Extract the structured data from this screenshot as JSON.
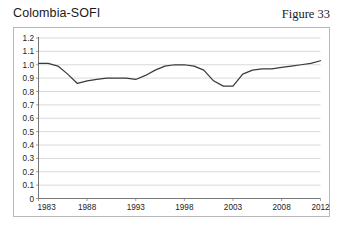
{
  "header": {
    "title": "Colombia-SOFI",
    "figure_label": "Figure 33"
  },
  "chart_data": {
    "type": "line",
    "title": "Colombia-SOFI",
    "xlabel": "",
    "ylabel": "",
    "xlim": [
      1983,
      2012
    ],
    "ylim": [
      0,
      1.2
    ],
    "grid": true,
    "legend": false,
    "y_ticks": [
      "0",
      "0.1",
      "0.2",
      "0.3",
      "0.4",
      "0.5",
      "0.6",
      "0.7",
      "0.8",
      "0.9",
      "1.0",
      "1.1",
      "1.2"
    ],
    "y_tick_values": [
      0,
      0.1,
      0.2,
      0.3,
      0.4,
      0.5,
      0.6,
      0.7,
      0.8,
      0.9,
      1.0,
      1.1,
      1.2
    ],
    "x_ticks": [
      "1983",
      "1988",
      "1993",
      "1998",
      "2003",
      "2008",
      "2012"
    ],
    "x_tick_values": [
      1983,
      1988,
      1993,
      1998,
      2003,
      2008,
      2012
    ],
    "series": [
      {
        "name": "Colombia-SOFI",
        "color": "#3a3a3a",
        "x": [
          1983,
          1984,
          1985,
          1986,
          1987,
          1988,
          1989,
          1990,
          1991,
          1992,
          1993,
          1994,
          1995,
          1996,
          1997,
          1998,
          1999,
          2000,
          2001,
          2002,
          2003,
          2004,
          2005,
          2006,
          2007,
          2008,
          2009,
          2010,
          2011,
          2012
        ],
        "values": [
          1.01,
          1.01,
          0.99,
          0.93,
          0.86,
          0.88,
          0.89,
          0.9,
          0.9,
          0.9,
          0.89,
          0.92,
          0.96,
          0.99,
          1.0,
          1.0,
          0.99,
          0.96,
          0.88,
          0.84,
          0.84,
          0.93,
          0.96,
          0.97,
          0.97,
          0.98,
          0.99,
          1.0,
          1.01,
          1.03
        ]
      }
    ]
  }
}
